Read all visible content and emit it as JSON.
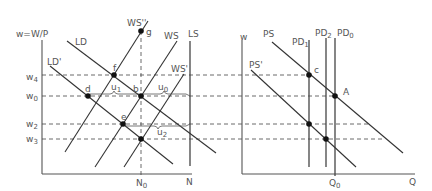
{
  "left_panel": {
    "y_axis_label": "w=W/P",
    "x_axis_label": "N",
    "x_tick": {
      "base": "N",
      "sub": "0"
    },
    "wage_levels": [
      {
        "base": "w",
        "sub": "4"
      },
      {
        "base": "w",
        "sub": "0"
      },
      {
        "base": "w",
        "sub": "2"
      },
      {
        "base": "w",
        "sub": "3"
      }
    ],
    "curves": {
      "LD": "LD",
      "LD_prime": "LD'",
      "WS": "WS",
      "WS_prime": "WS'",
      "WS_double_prime": "WS''",
      "LS": "LS"
    },
    "points": {
      "f": "f",
      "g": "g",
      "b": "b",
      "d": "d",
      "e": "e"
    },
    "unemployment": [
      {
        "base": "u",
        "sub": "1"
      },
      {
        "base": "u",
        "sub": "0"
      },
      {
        "base": "u",
        "sub": "2"
      }
    ]
  },
  "right_panel": {
    "y_axis_label": "w",
    "x_axis_label": "Q",
    "x_tick": {
      "base": "Q",
      "sub": "0"
    },
    "curves": {
      "PS": "PS",
      "PS_prime": "PS'",
      "PD1": {
        "base": "PD",
        "sub": "1"
      },
      "PD2": {
        "base": "PD",
        "sub": "2"
      },
      "PD0": {
        "base": "PD",
        "sub": "0"
      }
    },
    "points": {
      "c": "c",
      "A": "A"
    }
  }
}
